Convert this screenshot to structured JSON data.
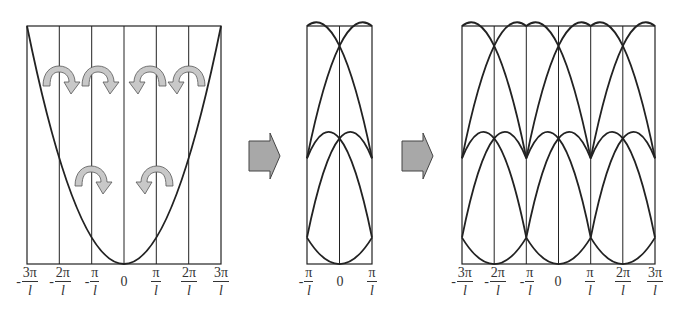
{
  "diagram": {
    "colors": {
      "line": "#222222",
      "arrow_fill": "#c8c8c8",
      "arrow_stroke": "#555555",
      "background": "#ffffff"
    },
    "panels": [
      {
        "name": "extended-zone",
        "ticks": [
          {
            "sign": "-",
            "num": "3π",
            "den": "l"
          },
          {
            "sign": "-",
            "num": "2π",
            "den": "l"
          },
          {
            "sign": "-",
            "num": "π",
            "den": "l"
          },
          {
            "sign": "",
            "num": "0",
            "den": ""
          },
          {
            "sign": "",
            "num": "π",
            "den": "l"
          },
          {
            "sign": "",
            "num": "2π",
            "den": "l"
          },
          {
            "sign": "",
            "num": "3π",
            "den": "l"
          }
        ]
      },
      {
        "name": "reduced-zone",
        "ticks": [
          {
            "sign": "-",
            "num": "π",
            "den": "l"
          },
          {
            "sign": "",
            "num": "0",
            "den": ""
          },
          {
            "sign": "",
            "num": "π",
            "den": "l"
          }
        ]
      },
      {
        "name": "repeated-zone",
        "ticks": [
          {
            "sign": "-",
            "num": "3π",
            "den": "l"
          },
          {
            "sign": "-",
            "num": "2π",
            "den": "l"
          },
          {
            "sign": "-",
            "num": "π",
            "den": "l"
          },
          {
            "sign": "",
            "num": "0",
            "den": ""
          },
          {
            "sign": "",
            "num": "π",
            "den": "l"
          },
          {
            "sign": "",
            "num": "2π",
            "den": "l"
          },
          {
            "sign": "",
            "num": "3π",
            "den": "l"
          }
        ]
      }
    ],
    "transition_arrows": [
      "right-arrow",
      "right-arrow"
    ]
  }
}
